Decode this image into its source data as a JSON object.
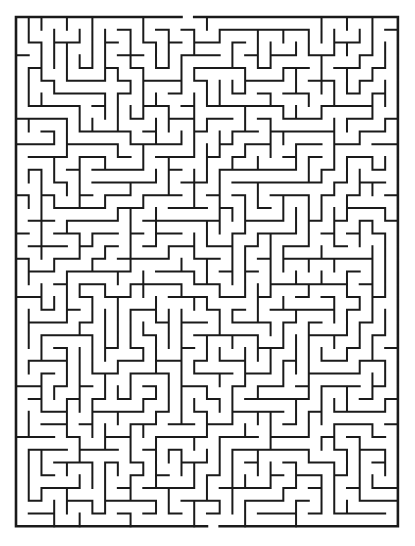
{
  "page": {
    "background_color": "#ffffff",
    "width": 415,
    "height": 546
  },
  "maze": {
    "name": "rectangular-perfect-maze",
    "type": "perfect",
    "cols": 30,
    "rows": 40,
    "cell_size": 12.73,
    "origin_x": 16,
    "origin_y": 17,
    "width": 382,
    "height": 511,
    "wall_color": "#1a1a1a",
    "background_color": "#ffffff",
    "wall_thickness": 2,
    "border_thickness": 2.6,
    "entrance": {
      "label": "Entrance",
      "side": "top",
      "column": 13
    },
    "exit": {
      "label": "Exit",
      "side": "bottom",
      "column": 15
    },
    "seed": 20240517
  }
}
